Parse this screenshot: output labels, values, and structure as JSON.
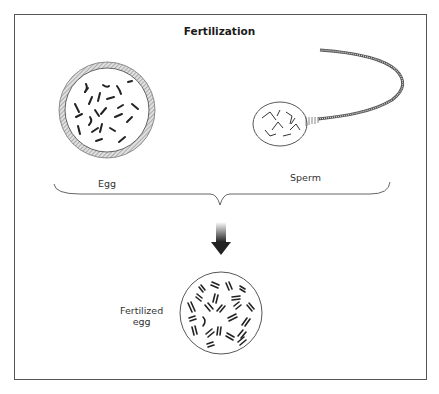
{
  "diagram": {
    "title": "Fertilization",
    "labels": {
      "egg": "Egg",
      "sperm": "Sperm",
      "fertilized_egg_line1": "Fertilized",
      "fertilized_egg_line2": "egg"
    },
    "colors": {
      "stroke": "#333333",
      "hatch": "#9a9a9a",
      "background": "#ffffff"
    }
  }
}
